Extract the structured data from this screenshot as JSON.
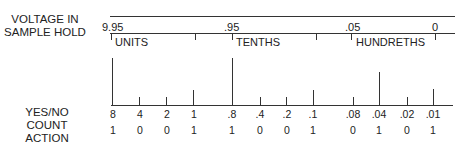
{
  "labels": {
    "voltage_line1": "VOLTAGE IN",
    "voltage_line2": "SAMPLE HOLD",
    "count_line1": "YES/NO",
    "count_line2": "COUNT",
    "count_line3": "ACTION"
  },
  "scale": {
    "markers": [
      ".95",
      "0"
    ],
    "start": "9.95",
    "mid1": ".95",
    "mid2": ".05",
    "end": "0"
  },
  "groups": [
    {
      "name": "UNITS"
    },
    {
      "name": "TENTHS"
    },
    {
      "name": "HUNDRETHS"
    }
  ],
  "weights": [
    "8",
    "4",
    "2",
    "1",
    ".8",
    ".4",
    ".2",
    ".1",
    ".08",
    ".04",
    ".02",
    ".01"
  ],
  "actions": [
    "1",
    "0",
    "0",
    "1",
    "1",
    "0",
    "0",
    "1",
    "0",
    "1",
    "0",
    "1"
  ],
  "colors": {
    "line": "#333333",
    "text": "#222222",
    "background": "#ffffff"
  }
}
